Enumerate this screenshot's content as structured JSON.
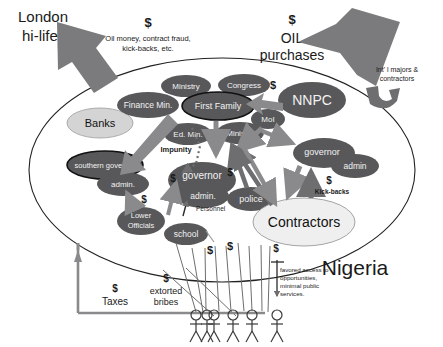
{
  "diagram": {
    "title_text": "Nigeria",
    "country_label": "Nigeria",
    "external": {
      "london": {
        "line1": "London",
        "line2": "hi-life"
      },
      "flow_in": {
        "dollar": "$",
        "line1": "Oil money, contract fraud,",
        "line2": "kick-backs, etc."
      },
      "oil": {
        "dollar": "$",
        "line1": "OIL",
        "line2": "purchases"
      },
      "majors": {
        "line1": "Int' l majors &",
        "line2": "contractors"
      }
    },
    "nodes": [
      {
        "id": "banks",
        "label": "Banks",
        "style": "light"
      },
      {
        "id": "finance-min",
        "label": "Finance Min.",
        "style": "dark"
      },
      {
        "id": "ministry-top",
        "label": "Ministry",
        "style": "dark"
      },
      {
        "id": "congress",
        "label": "Congress",
        "style": "dark"
      },
      {
        "id": "first-family",
        "label": "First Family",
        "style": "dark-outline"
      },
      {
        "id": "nnpc",
        "label": "NNPC",
        "style": "dark"
      },
      {
        "id": "moi",
        "label": "MoI",
        "style": "dark"
      },
      {
        "id": "ed-min",
        "label": "Ed. Min.",
        "style": "dark"
      },
      {
        "id": "ministry-mid",
        "label": "Ministry",
        "style": "dark"
      },
      {
        "id": "southern-gov",
        "label": "southern governor",
        "style": "dark-outline"
      },
      {
        "id": "southern-admin",
        "label": "admin.",
        "style": "dark"
      },
      {
        "id": "governor-center",
        "label": "governor",
        "style": "dark"
      },
      {
        "id": "admin-center",
        "label": "admin.",
        "style": "dark"
      },
      {
        "id": "police",
        "label": "police",
        "style": "dark"
      },
      {
        "id": "governor-right",
        "label": "governor",
        "style": "dark"
      },
      {
        "id": "admin-right",
        "label": "admin",
        "style": "dark"
      },
      {
        "id": "lower-officials",
        "label": "Lower Officials",
        "style": "dark"
      },
      {
        "id": "school",
        "label": "school",
        "style": "dark"
      },
      {
        "id": "contractors",
        "label": "Contractors",
        "style": "light"
      }
    ],
    "edge_labels": [
      {
        "id": "impunity",
        "text": "Impunity"
      },
      {
        "id": "personnel",
        "text": "Personnel"
      },
      {
        "id": "kickbacks",
        "dollar": "$",
        "text": "Kick-backs"
      },
      {
        "id": "dollar-moi",
        "text": "$"
      },
      {
        "id": "dollar-left",
        "text": "$"
      },
      {
        "id": "dollar-mid",
        "text": "$"
      },
      {
        "id": "dollar-low",
        "text": "$"
      },
      {
        "id": "dollar-school",
        "text": "$"
      }
    ],
    "bottom": {
      "taxes": {
        "dollar": "$",
        "text": "Taxes"
      },
      "bribes": {
        "dollar": "$",
        "line1": "extorted",
        "line2": "bribes"
      },
      "favored": {
        "line1": "favored access to",
        "line2": "opportunities,",
        "line3": "minimal public",
        "line4": "services."
      },
      "people_count": 6
    },
    "colors": {
      "dark_node": "#58585a",
      "light_node": "#d4d4d4",
      "arrow_gray": "#8a8a8c",
      "arrow_dark": "#6e6e70",
      "big_arrow": "#7b7b7d",
      "outline": "#111111",
      "text_light": "#f2f2f2",
      "text_dark": "#111111"
    }
  }
}
